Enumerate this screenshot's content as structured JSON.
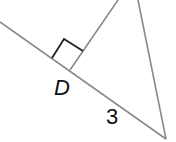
{
  "diagram": {
    "type": "geometry-triangle",
    "labels": {
      "point_d": "D",
      "segment_length": "3"
    },
    "colors": {
      "line": "#8a8a8a",
      "right_angle_marker": "#222222",
      "text": "#111111"
    },
    "elements": [
      {
        "kind": "line",
        "name": "base-line",
        "from": [
          0,
          22
        ],
        "to": [
          166,
          139
        ]
      },
      {
        "kind": "line",
        "name": "altitude",
        "from": [
          118,
          0
        ],
        "to": [
          70,
          70
        ]
      },
      {
        "kind": "line",
        "name": "right-side",
        "from": [
          138,
          0
        ],
        "to": [
          166,
          139
        ]
      },
      {
        "kind": "right-angle-marker",
        "at": "D"
      }
    ]
  }
}
